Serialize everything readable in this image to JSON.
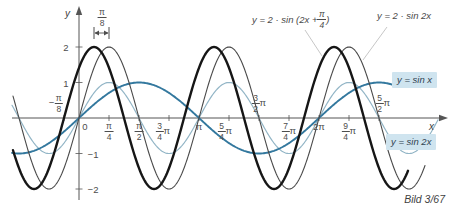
{
  "figure": {
    "caption": "Bild 3/67",
    "background": "#ffffff"
  },
  "chart_data": {
    "type": "line",
    "title": "",
    "xlabel": "x",
    "ylabel": "y",
    "ylim": [
      -2,
      2
    ],
    "grid": false,
    "axis_color": "#555555",
    "origin_px": [
      79,
      118
    ],
    "px_per_pi": 120,
    "px_per_unit_y": 35.5,
    "series": [
      {
        "name": "y = sin 2x",
        "amplitude": 1,
        "omega": 2,
        "phase": 0,
        "color": "#92b5c6",
        "width": 1.2,
        "px_start": 12,
        "px_end": 438
      },
      {
        "name": "y = sin x",
        "amplitude": 1,
        "omega": 1,
        "phase": 0,
        "color": "#33789e",
        "width": 1.9,
        "px_start": 12,
        "px_end": 397
      },
      {
        "name": "y = 2 · sin 2x",
        "amplitude": 2,
        "omega": 2,
        "phase": 0,
        "color": "#4a4a4a",
        "width": 1.1,
        "px_start": 13,
        "px_end": 425
      },
      {
        "name": "y = 2 · sin (2x + π/4)",
        "amplitude": 2,
        "omega": 2,
        "phase": 0.7853981634,
        "color": "#161616",
        "width": 2.4,
        "px_start": 13,
        "px_end": 408
      }
    ],
    "x_ticks": [
      {
        "v": -0.125,
        "prefix": "−",
        "num": "π",
        "den": "8",
        "side": "above",
        "dx": -8
      },
      {
        "v": 0,
        "text": "0",
        "side": "below",
        "dx": 6
      },
      {
        "v": 0.25,
        "num": "π",
        "den": "4",
        "side": "below"
      },
      {
        "v": 0.5,
        "num": "π",
        "den": "2",
        "side": "below"
      },
      {
        "v": 0.75,
        "num": "3",
        "den": "4",
        "suffix": "π",
        "side": "below",
        "dx": -6
      },
      {
        "v": 1,
        "text": "π",
        "side": "below"
      },
      {
        "v": 1.25,
        "num": "5",
        "den": "4",
        "suffix": "π",
        "side": "below",
        "dx": -4
      },
      {
        "v": 1.5,
        "num": "3",
        "den": "2",
        "suffix": "π",
        "side": "above"
      },
      {
        "v": 1.75,
        "num": "7",
        "den": "4",
        "suffix": "π",
        "side": "below"
      },
      {
        "v": 2,
        "text": "2π",
        "side": "below"
      },
      {
        "v": 2.25,
        "num": "9",
        "den": "4",
        "suffix": "π",
        "side": "below"
      },
      {
        "v": 2.5,
        "num": "5",
        "den": "2",
        "suffix": "π",
        "side": "above",
        "dx": 4
      }
    ],
    "y_ticks": [
      {
        "v": 2,
        "text": "2",
        "side": "left"
      },
      {
        "v": 1,
        "text": "1",
        "side": "left"
      },
      {
        "v": -1,
        "text": "−1",
        "side": "right"
      },
      {
        "v": -2,
        "text": "−2",
        "side": "right"
      }
    ],
    "callouts": [
      {
        "x1": 305,
        "y1": 30,
        "x2": 322,
        "y2": 56
      },
      {
        "x1": 387,
        "y1": 27,
        "x2": 363,
        "y2": 60
      }
    ]
  },
  "annotations": {
    "phase_gap": {
      "num": "π",
      "den": "8",
      "from_v": 0.125,
      "to_v": 0.25
    }
  },
  "legend": {
    "highlight_bg": "#cfe4ef",
    "eq1": {
      "pre": "y = 2 · sin (2x + ",
      "num": "π",
      "den": "4",
      "post": ")"
    },
    "eq2": {
      "text": "y = 2 · sin 2x"
    },
    "eq3": {
      "text": "y = sin x"
    },
    "eq4": {
      "text": "y = sin 2x"
    }
  }
}
